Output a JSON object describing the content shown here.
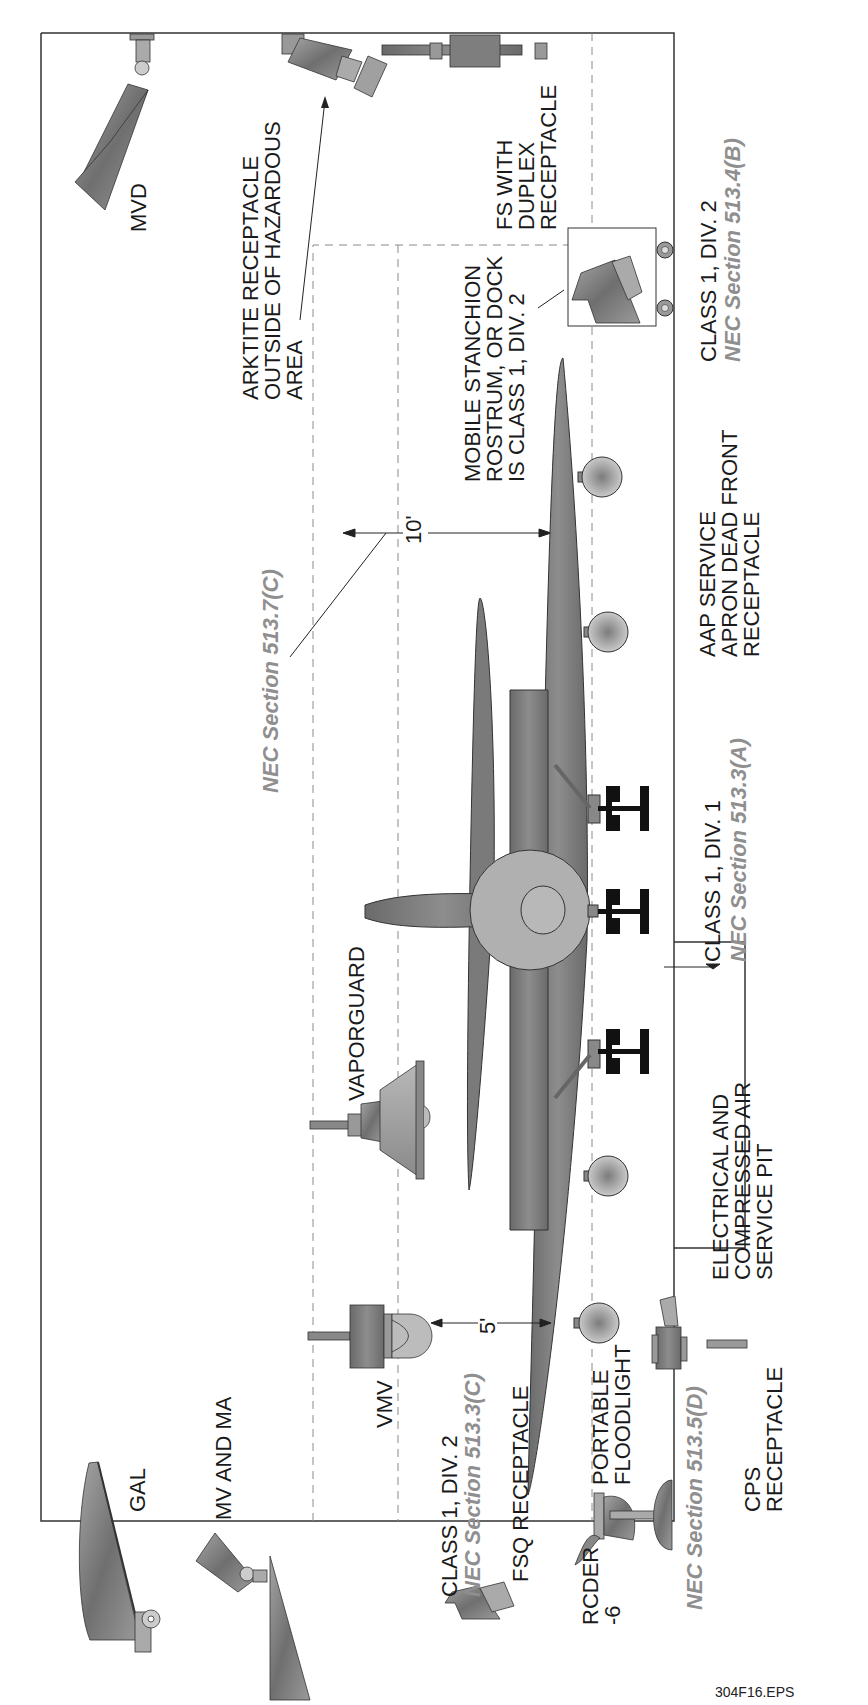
{
  "figure": {
    "file_id": "304F16.EPS",
    "accent_gray": "#8f8f8f",
    "fixture_gray": "#8a8a8a",
    "body_gray": "#7d7d7d"
  },
  "labels": {
    "mvd": "MVD",
    "arktite": "ARKTITE RECEPTACLE\nOUTSIDE OF HAZARDOUS\nAREA",
    "fs_duplex": "FS WITH\nDUPLEX\nRECEPTACLE",
    "mobile_stanchion": "MOBILE STANCHION\nROSTRUM, OR DOCK\nIS CLASS 1, DIV. 2",
    "class1div2_right": "CLASS 1, DIV. 2",
    "nec_513_4b": "NEC Section 513.4(B)",
    "nec_513_7c": "NEC Section 513.7(C)",
    "ten_feet": "10'",
    "aap_service": "AAP SERVICE\nAPRON DEAD FRONT\nRECEPTACLE",
    "class1div1": "CLASS 1, DIV. 1",
    "nec_513_3a": "NEC Section 513.3(A)",
    "vaporguard": "VAPORGUARD",
    "electrical_pit": "ELECTRICAL AND\nCOMPRESSED AIR\nSERVICE PIT",
    "vmv": "VMV",
    "five_feet": "5'",
    "mv_and_ma": "MV AND MA",
    "gal": "GAL",
    "class1div2_left": "CLASS 1, DIV. 2",
    "nec_513_3c": "NEC Section 513.3(C)",
    "fsq_receptacle": "FSQ RECEPTACLE",
    "rcder": "RCDER\n-6",
    "portable_floodlight": "PORTABLE\nFLOODLIGHT",
    "nec_513_5d": "NEC Section 513.5(D)",
    "cps_receptacle": "CPS\nRECEPTACLE"
  }
}
